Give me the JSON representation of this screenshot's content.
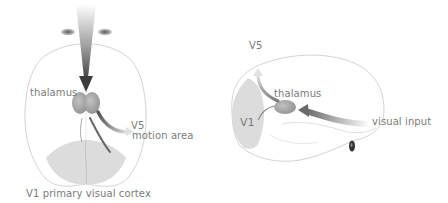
{
  "colors": {
    "background": "#ffffff",
    "outline": "#c8c8c8",
    "v1_fill": "#dcdcdc",
    "thalamus_fill": "#a7a7a7",
    "label": "#7a7a7a",
    "arrow_dark": "#555555"
  },
  "top_view": {
    "labels": {
      "thalamus": "thalamus",
      "v5": "V5",
      "motion_area": "motion area",
      "v1": "V1 primary visual cortex"
    }
  },
  "side_view": {
    "labels": {
      "v5": "V5",
      "thalamus": "thalamus",
      "v1": "V1",
      "visual_input": "visual input"
    }
  }
}
